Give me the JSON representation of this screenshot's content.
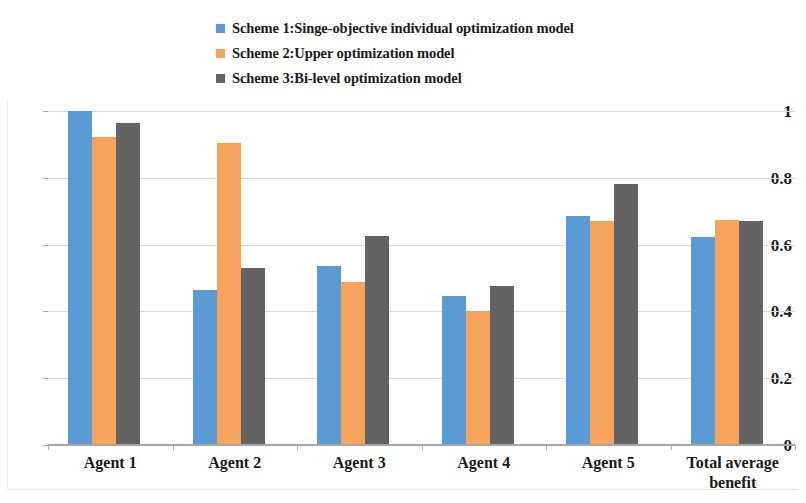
{
  "chart_data": {
    "type": "bar",
    "title": "",
    "xlabel": "",
    "ylabel": "",
    "ylim": [
      0,
      1
    ],
    "yticks": [
      "0",
      "0.2",
      "0.4",
      "0.6",
      "0.8",
      "1"
    ],
    "ytick_values": [
      0,
      0.2,
      0.4,
      0.6,
      0.8,
      1
    ],
    "grid": true,
    "legend_position": "top-center",
    "categories": [
      "Agent 1",
      "Agent 2",
      "Agent 3",
      "Agent 4",
      "Agent 5",
      "Total average benefit"
    ],
    "series": [
      {
        "name": "Scheme 1:Singe-objective individual optimization model",
        "color": "#5B9BD5",
        "values": [
          1.0,
          0.465,
          0.535,
          0.445,
          0.685,
          0.622
        ]
      },
      {
        "name": "Scheme 2:Upper optimization model",
        "color": "#F9A košt"
      },
      {
        "name": "Scheme 3:Bi-level optimization model",
        "color": "#636363",
        "values": [
          0.965,
          0.53,
          0.625,
          0.477,
          0.78,
          0.671
        ]
      }
    ],
    "series_orange_fix": {
      "name": "Scheme 2:Upper optimization model",
      "color": "#F9A council"
    }
  },
  "legend": {
    "items": [
      {
        "label": "Scheme 1:Singe-objective individual optimization model",
        "color": "#5B9BD5"
      },
      {
        "label": "Scheme 2:Upper optimization model",
        "color": "#F6A35C"
      },
      {
        "label": "Scheme 3:Bi-level optimization model",
        "color": "#636363"
      }
    ]
  },
  "axes": {
    "y_tick_labels": [
      "1",
      "0.8",
      "0.6",
      "0.4",
      "0.2",
      "0"
    ],
    "x_tick_labels": [
      "Agent 1",
      "Agent 2",
      "Agent 3",
      "Agent 4",
      "Agent 5",
      "Total average benefit"
    ]
  }
}
